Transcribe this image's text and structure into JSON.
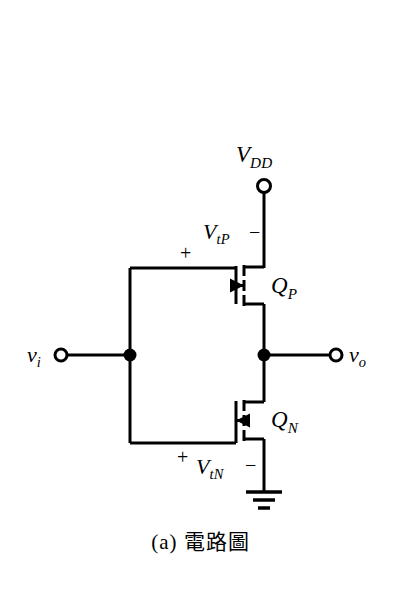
{
  "figure": {
    "caption": "(a) 電路圖",
    "background_color": "#ffffff",
    "line_color": "#000000",
    "type": "schematic"
  },
  "labels": {
    "supply": {
      "symbol": "V",
      "subscript": "DD",
      "name": "V_DD supply terminal"
    },
    "input": {
      "symbol": "v",
      "subscript": "i",
      "name": "v_i input terminal"
    },
    "output": {
      "symbol": "v",
      "subscript": "o",
      "name": "v_o output terminal"
    },
    "pmos_device": {
      "symbol": "Q",
      "subscript": "P"
    },
    "nmos_device": {
      "symbol": "Q",
      "subscript": "N"
    },
    "vtp": {
      "symbol": "V",
      "subscript": "tP",
      "plus": "+",
      "minus": "−"
    },
    "vtn": {
      "symbol": "V",
      "subscript": "tN",
      "plus": "+",
      "minus": "−"
    }
  },
  "components": {
    "pmos": {
      "name": "PMOS transistor",
      "arrow_direction": "into-channel"
    },
    "nmos": {
      "name": "NMOS transistor",
      "arrow_direction": "toward-gate"
    },
    "ground": {
      "name": "ground symbol",
      "bars": 3
    },
    "nodes": [
      {
        "name": "input-junction-dot",
        "x": 130,
        "y": 355
      },
      {
        "name": "output-junction-dot",
        "x": 264,
        "y": 355
      }
    ],
    "terminals": [
      {
        "name": "vdd-terminal-circle",
        "x": 264,
        "y": 186
      },
      {
        "name": "vi-terminal-circle",
        "x": 61,
        "y": 355
      },
      {
        "name": "vo-terminal-circle",
        "x": 336,
        "y": 355
      }
    ]
  }
}
